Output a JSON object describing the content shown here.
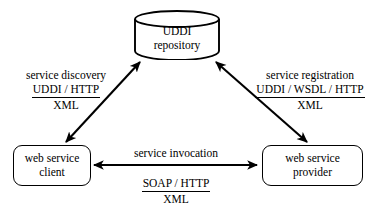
{
  "diagram": {
    "colors": {
      "background": "#ffffff",
      "stroke": "#000000",
      "text": "#000000"
    },
    "nodes": [
      {
        "id": "uddi-repository",
        "shape": "cylinder",
        "lines": [
          "UDDI",
          "repository"
        ]
      },
      {
        "id": "web-service-client",
        "shape": "rounded-rect",
        "lines": [
          "web service",
          "client"
        ]
      },
      {
        "id": "web-service-provider",
        "shape": "rounded-rect",
        "lines": [
          "web service",
          "provider"
        ]
      }
    ],
    "edges": [
      {
        "id": "service-discovery",
        "from": "web-service-client",
        "to": "uddi-repository",
        "arrowheads": "both",
        "title": "service discovery",
        "protocol": "UDDI / HTTP",
        "format": "XML"
      },
      {
        "id": "service-registration",
        "from": "web-service-provider",
        "to": "uddi-repository",
        "arrowheads": "both",
        "title": "service registration",
        "protocol": "UDDI / WSDL / HTTP",
        "format": "XML"
      },
      {
        "id": "service-invocation",
        "from": "web-service-client",
        "to": "web-service-provider",
        "arrowheads": "both",
        "title": "service invocation",
        "protocol": "SOAP / HTTP",
        "format": "XML"
      }
    ]
  }
}
